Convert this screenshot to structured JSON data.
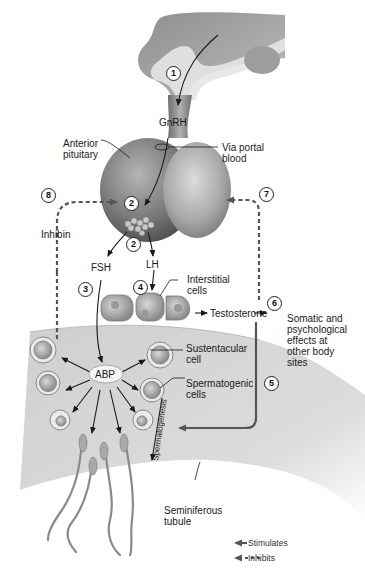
{
  "figure": {
    "steps": [
      "1",
      "2",
      "2",
      "3",
      "4",
      "5",
      "6",
      "7",
      "8"
    ],
    "labels": {
      "gnrh": "GnRH",
      "anterior_pituitary": "Anterior\npituitary",
      "via_portal_blood": "Via portal\nblood",
      "inhibin": "Inhibin",
      "fsh": "FSH",
      "lh": "LH",
      "interstitial_cells": "Interstitial\ncells",
      "testosterone": "Testosterone",
      "somatic_effects": "Somatic and\npsychological\neffects at\nother body\nsites",
      "sustentacular_cell": "Sustentacular\ncell",
      "abp": "ABP",
      "spermatogenic_cells": "Spermatogenic\ncells",
      "spermatogenesis": "Spermatogenesis",
      "seminiferous_tubule": "Seminiferous\ntubule"
    },
    "legend": [
      {
        "style": "solid",
        "label": "Stimulates"
      },
      {
        "style": "dashed",
        "label": "Inhibits"
      }
    ],
    "colors": {
      "arrow": "#1a1a1a",
      "feedback_path": "#555555",
      "tissue_light": "#d9d9d9",
      "tissue_mid": "#9a9a9a",
      "tissue_dark": "#6a6a6a"
    }
  }
}
